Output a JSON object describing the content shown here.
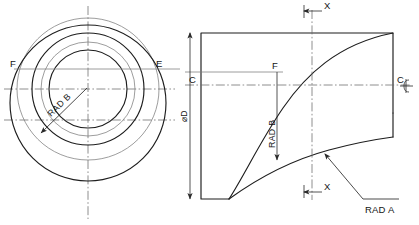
{
  "drawing": {
    "title": "Engineering part drawing - two orthographic views",
    "background_color": "#ffffff",
    "line_color": "#1d1d1d",
    "construction_color": "#7c7c7c",
    "center_color": "#6a6a6a",
    "width": 419,
    "height": 225
  },
  "left_view": {
    "name": "end-view-circles",
    "labels": {
      "point_f": "F",
      "point_e": "E",
      "rad_b": "RAD B"
    }
  },
  "right_view": {
    "name": "section-view",
    "labels": {
      "point_f": "F",
      "section_mark_top": "X",
      "section_mark_bottom": "X",
      "datum_c_left": "C",
      "datum_c_right": "C",
      "centerline_symbol": "℄",
      "diameter_d": "⌀D",
      "rad_b": "RAD B",
      "rad_a": "RAD A"
    }
  }
}
